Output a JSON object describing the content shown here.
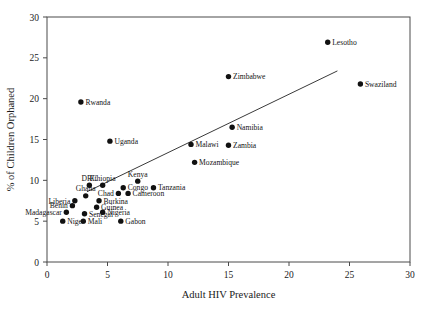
{
  "chart_data": {
    "type": "scatter",
    "title": "",
    "xlabel": "Adult HIV Prevalence",
    "ylabel": "% of Children Orphaned",
    "xlim": [
      0,
      30
    ],
    "ylim": [
      0,
      30
    ],
    "xticks": [
      0,
      5,
      10,
      15,
      20,
      25,
      30
    ],
    "yticks": [
      0,
      5,
      10,
      15,
      20,
      25,
      30
    ],
    "grid": false,
    "legend": null,
    "trendline": {
      "x": [
        3.3,
        24.0
      ],
      "y": [
        8.6,
        23.4
      ],
      "style": "solid"
    },
    "points": [
      {
        "label": "Lesotho",
        "x": 23.2,
        "y": 26.9,
        "label_pos": "right"
      },
      {
        "label": "Swaziland",
        "x": 25.9,
        "y": 21.8,
        "label_pos": "right"
      },
      {
        "label": "Zimbabwe",
        "x": 15.0,
        "y": 22.7,
        "label_pos": "right"
      },
      {
        "label": "Rwanda",
        "x": 2.8,
        "y": 19.6,
        "label_pos": "right"
      },
      {
        "label": "Namibia",
        "x": 15.3,
        "y": 16.5,
        "label_pos": "right"
      },
      {
        "label": "Uganda",
        "x": 5.2,
        "y": 14.8,
        "label_pos": "right"
      },
      {
        "label": "Malawi",
        "x": 11.9,
        "y": 14.4,
        "label_pos": "right"
      },
      {
        "label": "Zambia",
        "x": 15.0,
        "y": 14.3,
        "label_pos": "right"
      },
      {
        "label": "Mozambique",
        "x": 12.2,
        "y": 12.2,
        "label_pos": "right"
      },
      {
        "label": "Kenya",
        "x": 7.5,
        "y": 9.9,
        "label_pos": "above"
      },
      {
        "label": "Tanzania",
        "x": 8.8,
        "y": 9.1,
        "label_pos": "right"
      },
      {
        "label": "Congo",
        "x": 6.3,
        "y": 9.1,
        "label_pos": "right"
      },
      {
        "label": "Cameroon",
        "x": 6.7,
        "y": 8.4,
        "label_pos": "right"
      },
      {
        "label": "DRC",
        "x": 3.5,
        "y": 9.4,
        "label_pos": "above"
      },
      {
        "label": "Ethiopia",
        "x": 4.6,
        "y": 9.4,
        "label_pos": "above"
      },
      {
        "label": "Chad",
        "x": 5.9,
        "y": 8.4,
        "label_pos": "left"
      },
      {
        "label": "Ghana",
        "x": 3.2,
        "y": 8.1,
        "label_pos": "above"
      },
      {
        "label": "Liberia",
        "x": 2.3,
        "y": 7.5,
        "label_pos": "left"
      },
      {
        "label": "Burkina",
        "x": 4.3,
        "y": 7.5,
        "label_pos": "right"
      },
      {
        "label": "Benin",
        "x": 2.1,
        "y": 6.9,
        "label_pos": "left"
      },
      {
        "label": "Guinea",
        "x": 4.1,
        "y": 6.7,
        "label_pos": "right"
      },
      {
        "label": "Madagascar",
        "x": 1.6,
        "y": 6.1,
        "label_pos": "left"
      },
      {
        "label": "Senegal",
        "x": 3.1,
        "y": 5.9,
        "label_pos": "right"
      },
      {
        "label": "Nigeria",
        "x": 4.6,
        "y": 6.1,
        "label_pos": "right"
      },
      {
        "label": "Niger",
        "x": 1.3,
        "y": 5.0,
        "label_pos": "right"
      },
      {
        "label": "Mali",
        "x": 3.0,
        "y": 5.0,
        "label_pos": "right"
      },
      {
        "label": "Gabon",
        "x": 6.1,
        "y": 5.0,
        "label_pos": "right"
      }
    ]
  },
  "colors": {
    "dot": "#111111",
    "line": "#3a3a3a",
    "frame": "#4a4a4a",
    "text": "#141414",
    "background": "#ffffff"
  }
}
